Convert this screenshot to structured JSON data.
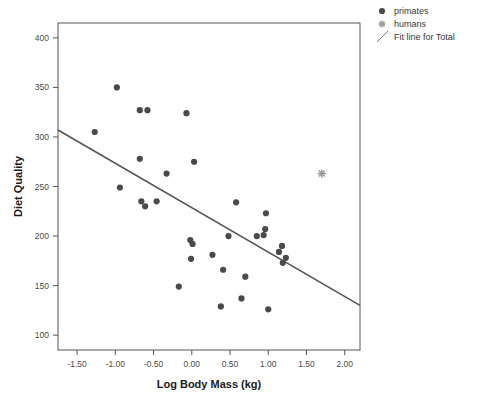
{
  "chart_data": {
    "type": "scatter",
    "title": "",
    "xlabel": "Log Body Mass (kg)",
    "ylabel": "Diet Quality",
    "xlim": [
      -1.75,
      2.2
    ],
    "ylim": [
      85,
      415
    ],
    "grid": false,
    "legend_position": "top-right",
    "xticks": [
      -1.5,
      -1.0,
      -0.5,
      0.0,
      0.5,
      1.0,
      1.5,
      2.0
    ],
    "xtick_labels": [
      "-1.50",
      "-1.00",
      "-0.50",
      "0.00",
      "0.50",
      "1.00",
      "1.50",
      "2.00"
    ],
    "yticks": [
      100,
      150,
      200,
      250,
      300,
      350,
      400
    ],
    "ytick_labels": [
      "100",
      "150",
      "200",
      "250",
      "300",
      "350",
      "400"
    ],
    "legend": [
      {
        "label": "primates",
        "marker": "circle",
        "color": "#4a4a4a"
      },
      {
        "label": "humans",
        "marker": "asterisk",
        "color": "#9a9a9a"
      },
      {
        "label": "Fit line for Total",
        "marker": "line",
        "color": "#555555"
      }
    ],
    "series": [
      {
        "name": "primates",
        "marker": "circle",
        "color": "#4a4a4a",
        "points": [
          {
            "x": -1.27,
            "y": 305
          },
          {
            "x": -0.98,
            "y": 350
          },
          {
            "x": -0.94,
            "y": 249
          },
          {
            "x": -0.68,
            "y": 327
          },
          {
            "x": -0.68,
            "y": 278
          },
          {
            "x": -0.66,
            "y": 235
          },
          {
            "x": -0.61,
            "y": 230
          },
          {
            "x": -0.58,
            "y": 327
          },
          {
            "x": -0.46,
            "y": 235
          },
          {
            "x": -0.33,
            "y": 263
          },
          {
            "x": -0.17,
            "y": 149
          },
          {
            "x": -0.07,
            "y": 324
          },
          {
            "x": -0.02,
            "y": 196
          },
          {
            "x": -0.01,
            "y": 177
          },
          {
            "x": 0.01,
            "y": 192
          },
          {
            "x": 0.03,
            "y": 275
          },
          {
            "x": 0.27,
            "y": 181
          },
          {
            "x": 0.38,
            "y": 129
          },
          {
            "x": 0.41,
            "y": 166
          },
          {
            "x": 0.48,
            "y": 200
          },
          {
            "x": 0.58,
            "y": 234
          },
          {
            "x": 0.65,
            "y": 137
          },
          {
            "x": 0.7,
            "y": 159
          },
          {
            "x": 0.85,
            "y": 200
          },
          {
            "x": 0.94,
            "y": 201
          },
          {
            "x": 0.96,
            "y": 207
          },
          {
            "x": 0.97,
            "y": 223
          },
          {
            "x": 1.0,
            "y": 126
          },
          {
            "x": 1.14,
            "y": 184
          },
          {
            "x": 1.18,
            "y": 190
          },
          {
            "x": 1.19,
            "y": 173
          },
          {
            "x": 1.23,
            "y": 178
          }
        ]
      },
      {
        "name": "humans",
        "marker": "asterisk",
        "color": "#9a9a9a",
        "points": [
          {
            "x": 1.7,
            "y": 263
          }
        ]
      }
    ],
    "fit_line": {
      "name": "Fit line for Total",
      "color": "#555555",
      "x_start": -1.75,
      "y_start": 307,
      "x_end": 2.2,
      "y_end": 130
    }
  }
}
